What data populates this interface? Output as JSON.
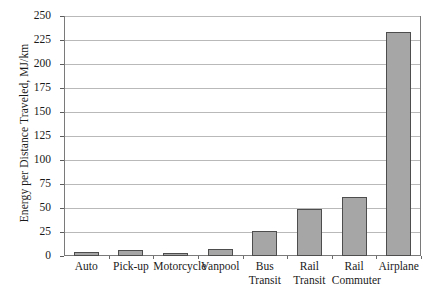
{
  "chart_data": {
    "type": "bar",
    "title": "",
    "xlabel": "",
    "ylabel": "Energy per Distance Traveled, MJ/km",
    "categories": [
      "Auto",
      "Pick-up",
      "Motorcycle",
      "Vanpool",
      "Bus Transit",
      "Rail Transit",
      "Rail Commuter",
      "Airplane"
    ],
    "category_lines": [
      [
        "Auto",
        ""
      ],
      [
        "Pick-up",
        ""
      ],
      [
        "Motorcycle",
        ""
      ],
      [
        "Vanpool",
        ""
      ],
      [
        "Bus",
        "Transit"
      ],
      [
        "Rail",
        "Transit"
      ],
      [
        "Rail",
        "Commuter"
      ],
      [
        "Airplane",
        ""
      ]
    ],
    "values": [
      4,
      6,
      2,
      7,
      26,
      49,
      61,
      233
    ],
    "ylim": [
      0,
      250
    ],
    "yticks": [
      0,
      25,
      50,
      75,
      100,
      125,
      150,
      175,
      200,
      225,
      250
    ],
    "ytick_labels": [
      "0",
      "25",
      "50",
      "75",
      "100",
      "125",
      "150",
      "175",
      "200",
      "225",
      "250"
    ],
    "grid": true,
    "legend": "none",
    "bar_color": "#a6a6a6",
    "bar_edge_color": "#4d4d4d",
    "gridline_color": "#b9b9b9",
    "axis_color": "#7a7a7a"
  }
}
